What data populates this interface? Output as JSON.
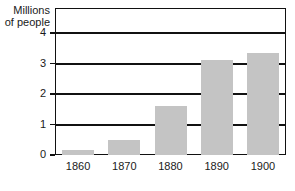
{
  "chart_data": {
    "type": "bar",
    "title": "",
    "subtitle": "",
    "xlabel": "",
    "ylabel": "Millions\nof people",
    "categories": [
      "1860",
      "1870",
      "1880",
      "1890",
      "1900"
    ],
    "values": [
      0.15,
      0.5,
      1.6,
      3.1,
      3.35
    ],
    "ylim": [
      0,
      4.8
    ],
    "yticks": [
      0,
      1,
      2,
      3,
      4
    ],
    "ytick_labels": [
      "0",
      "1",
      "2",
      "3",
      "4"
    ],
    "grid": true,
    "grid_axis": "y",
    "legend": false,
    "legend_position": "none",
    "bar_color": "#c4c4c4",
    "axis_color": "#111111",
    "background_color": "#ffffff",
    "text_color": "#1a1a1a"
  }
}
